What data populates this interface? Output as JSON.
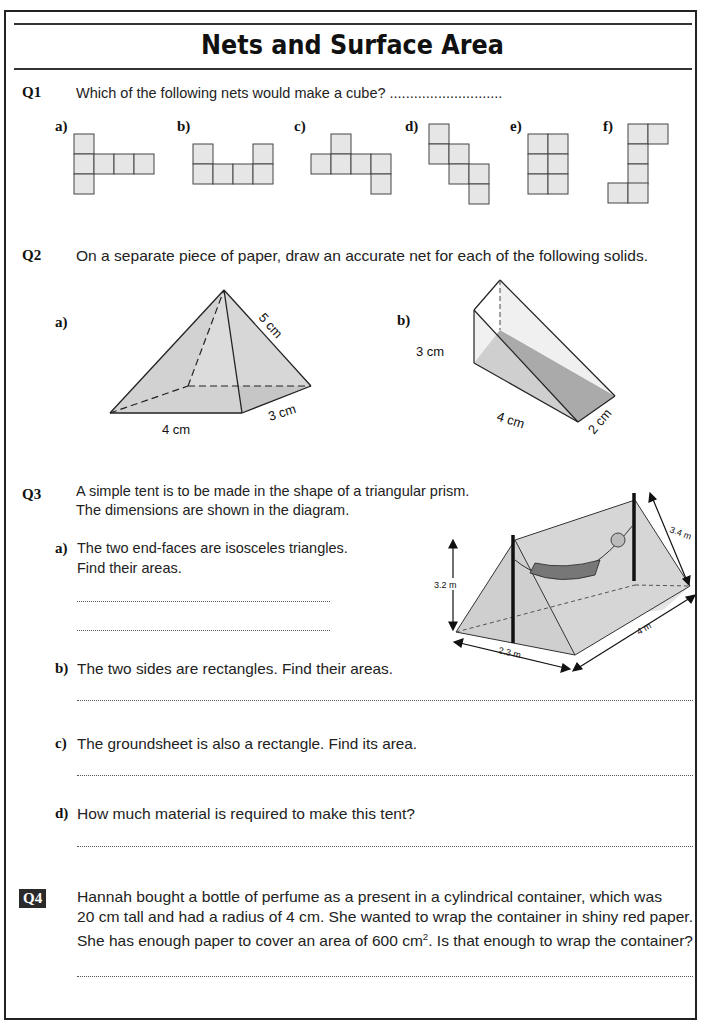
{
  "header": {
    "title": "Nets and Surface Area"
  },
  "q1": {
    "number": "Q1",
    "prompt": "Which of the following nets would make a cube? ............................",
    "nets": [
      {
        "label": "a)"
      },
      {
        "label": "b)"
      },
      {
        "label": "c)"
      },
      {
        "label": "d)"
      },
      {
        "label": "e)"
      },
      {
        "label": "f)"
      }
    ]
  },
  "q2": {
    "number": "Q2",
    "prompt": "On a separate piece of paper, draw an accurate net for each of the following solids.",
    "a": {
      "label": "a)",
      "dims": [
        "5 cm",
        "4 cm",
        "3 cm"
      ]
    },
    "b": {
      "label": "b)",
      "dims": [
        "3 cm",
        "4 cm",
        "2 cm"
      ]
    }
  },
  "q3": {
    "number": "Q3",
    "intro_line1": "A simple tent is to be made in the shape of a triangular prism.",
    "intro_line2": "The dimensions are shown in the diagram.",
    "a": {
      "label": "a)",
      "line1": "The two end-faces are isosceles triangles.",
      "line2": "Find their areas."
    },
    "b": {
      "label": "b)",
      "text": "The two sides are rectangles.  Find their areas."
    },
    "c": {
      "label": "c)",
      "text": "The groundsheet is also a rectangle.  Find its area."
    },
    "d": {
      "label": "d)",
      "text": "How much material is required to make this tent?"
    },
    "diagram": {
      "height": "3.2 m",
      "base": "2.3 m",
      "length": "4 m",
      "slant": "3.4 m"
    }
  },
  "q4": {
    "number": "Q4",
    "line1": "Hannah bought a bottle of perfume as a present in a cylindrical container, which was",
    "line2": "20 cm tall and had a radius of 4 cm.  She wanted to wrap the container in shiny red paper.",
    "line3_pre": "She has enough paper to cover an area of 600 cm",
    "line3_sup": "2",
    "line3_post": ".  Is that enough to wrap the container?"
  }
}
